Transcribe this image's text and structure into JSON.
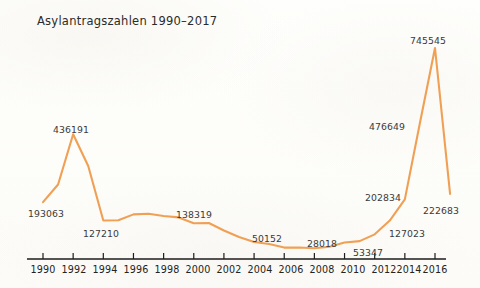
{
  "chart_data": {
    "type": "line",
    "title": "Asylantragszahlen 1990–2017",
    "xlabel": "",
    "ylabel": "",
    "xlim": [
      1990,
      2017
    ],
    "ylim": [
      0,
      790000
    ],
    "grid": false,
    "legend": "none",
    "line_color": "#f0a055",
    "x": [
      1990,
      1991,
      1992,
      1993,
      1994,
      1995,
      1996,
      1997,
      1998,
      1999,
      2000,
      2001,
      2002,
      2003,
      2004,
      2005,
      2006,
      2007,
      2008,
      2009,
      2010,
      2011,
      2012,
      2013,
      2014,
      2015,
      2016,
      2017
    ],
    "values": [
      193063,
      256112,
      436191,
      322599,
      127210,
      127937,
      149193,
      151700,
      143429,
      138319,
      117648,
      118306,
      91471,
      67848,
      50152,
      42908,
      30100,
      30303,
      28018,
      33033,
      48589,
      53347,
      77651,
      127023,
      202834,
      476649,
      745545,
      222683
    ],
    "point_labels": [
      {
        "year": 1990,
        "value": 193063,
        "text": "193063"
      },
      {
        "year": 1992,
        "value": 436191,
        "text": "436191"
      },
      {
        "year": 1994,
        "value": 127210,
        "text": "127210"
      },
      {
        "year": 1999,
        "value": 138319,
        "text": "138319"
      },
      {
        "year": 2004,
        "value": 50152,
        "text": "50152"
      },
      {
        "year": 2008,
        "value": 28018,
        "text": "28018"
      },
      {
        "year": 2011,
        "value": 53347,
        "text": "53347"
      },
      {
        "year": 2013,
        "value": 127023,
        "text": "127023"
      },
      {
        "year": 2014,
        "value": 202834,
        "text": "202834"
      },
      {
        "year": 2015,
        "value": 476649,
        "text": "476649"
      },
      {
        "year": 2016,
        "value": 745545,
        "text": "745545"
      },
      {
        "year": 2017,
        "value": 222683,
        "text": "222683"
      }
    ],
    "xticks": [
      1990,
      1992,
      1994,
      1996,
      1998,
      2000,
      2002,
      2004,
      2006,
      2008,
      2010,
      2012,
      2014,
      2016
    ],
    "xtick_labels": [
      "1990",
      "1992",
      "1994",
      "1996",
      "1998",
      "2000",
      "2002",
      "2004",
      "2006",
      "2008",
      "2010",
      "2012",
      "2014",
      "2016"
    ]
  },
  "labels": {
    "l_193063": "193063",
    "l_436191": "436191",
    "l_127210": "127210",
    "l_138319": "138319",
    "l_50152": "50152",
    "l_28018": "28018",
    "l_53347": "53347",
    "l_127023": "127023",
    "l_202834": "202834",
    "l_476649": "476649",
    "l_745545": "745545",
    "l_222683": "222683"
  },
  "ticks": {
    "t1990": "1990",
    "t1992": "1992",
    "t1994": "1994",
    "t1996": "1996",
    "t1998": "1998",
    "t2000": "2000",
    "t2002": "2002",
    "t2004": "2004",
    "t2006": "2006",
    "t2008": "2008",
    "t2010": "2010",
    "t2012": "2012",
    "t2014": "2014",
    "t2016": "2016"
  }
}
